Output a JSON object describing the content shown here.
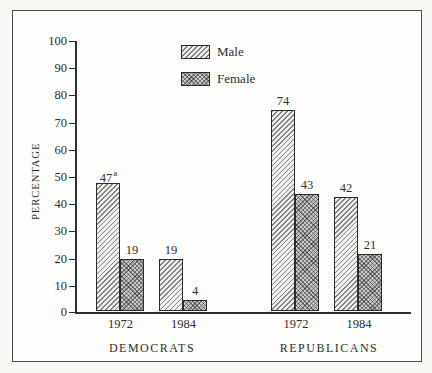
{
  "chart_data": {
    "type": "bar",
    "title": "",
    "xlabel": "",
    "ylabel": "PERCENTAGE",
    "ylim": [
      0,
      100
    ],
    "ytick_step": 10,
    "yticks": [
      "100",
      "90",
      "80",
      "70",
      "60",
      "50",
      "40",
      "30",
      "20",
      "10",
      "0"
    ],
    "grid": false,
    "legend_position": "top-center",
    "legend": [
      {
        "name": "Male",
        "pattern": "diagonal-hatch"
      },
      {
        "name": "Female",
        "pattern": "crosshatch"
      }
    ],
    "footnote_marker": "a",
    "groups": [
      {
        "label": "DEMOCRATS",
        "clusters": [
          {
            "category": "1972",
            "values": [
              47,
              19
            ],
            "notes": [
              "a",
              ""
            ]
          },
          {
            "category": "1984",
            "values": [
              19,
              4
            ],
            "notes": [
              "",
              ""
            ]
          }
        ]
      },
      {
        "label": "REPUBLICANS",
        "clusters": [
          {
            "category": "1972",
            "values": [
              74,
              43
            ],
            "notes": [
              "",
              ""
            ]
          },
          {
            "category": "1984",
            "values": [
              42,
              21
            ],
            "notes": [
              "",
              ""
            ]
          }
        ]
      }
    ],
    "series": [
      {
        "name": "Male",
        "values": [
          47,
          19,
          74,
          42
        ]
      },
      {
        "name": "Female",
        "values": [
          19,
          4,
          43,
          21
        ]
      }
    ],
    "colors": {
      "ink": "#2e2e2e",
      "male_fill": "#f0efec",
      "female_fill": "#c9c8c6"
    }
  }
}
